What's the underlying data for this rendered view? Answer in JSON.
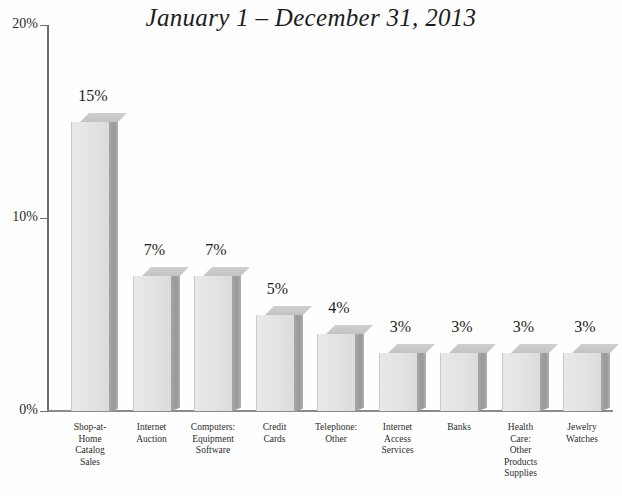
{
  "chart_data": {
    "type": "bar",
    "title": "January 1 – December 31, 2013",
    "xlabel": "",
    "ylabel": "",
    "ylim": [
      0,
      20
    ],
    "yunit": "%",
    "grid": false,
    "legend": "none",
    "style": "3d-bar",
    "ytick_labels": [
      "20%",
      "10%",
      "0%"
    ],
    "ytick_values": [
      20,
      10,
      0
    ],
    "categories": [
      "Shop-at-Home Catalog Sales",
      "Internet Auction",
      "Computers: Equipment Software",
      "Credit Cards",
      "Telephone: Other",
      "Internet Access Services",
      "Banks",
      "Health Care: Other Products Supplies",
      "Jewelry Watches"
    ],
    "category_lines": [
      [
        "Shop-at-",
        "Home",
        "Catalog",
        "Sales"
      ],
      [
        "Internet",
        "Auction"
      ],
      [
        "Computers:",
        "Equipment",
        "Software"
      ],
      [
        "Credit",
        "Cards"
      ],
      [
        "Telephone:",
        "Other"
      ],
      [
        "Internet",
        "Access",
        "Services"
      ],
      [
        "Banks"
      ],
      [
        "Health",
        "Care:",
        "Other",
        "Products",
        "Supplies"
      ],
      [
        "Jewelry",
        "Watches"
      ]
    ],
    "values": [
      15,
      7,
      7,
      5,
      4,
      3,
      3,
      3,
      3
    ],
    "value_labels": [
      "15%",
      "7%",
      "7%",
      "5%",
      "4%",
      "3%",
      "3%",
      "3%",
      "3%"
    ]
  },
  "colors": {
    "background": "#ffffff",
    "bar_front": "#e6e6e7",
    "bar_side": "#a2a2a2",
    "bar_top": "#c7c7c7",
    "axis": "#6e6e6e",
    "text": "#2b2b2b"
  }
}
